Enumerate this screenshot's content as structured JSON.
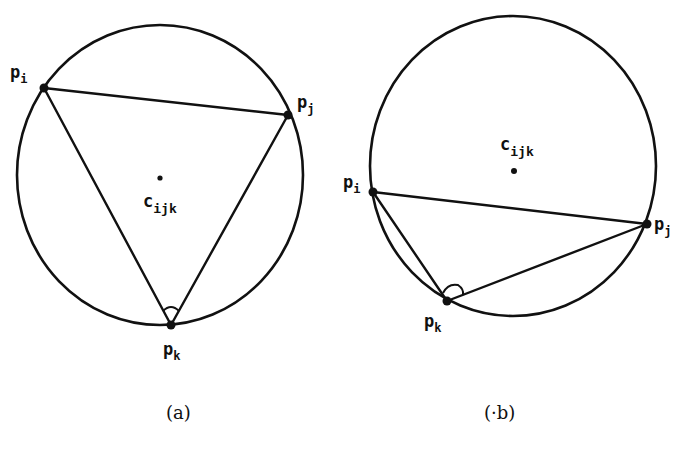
{
  "figure": {
    "panels": [
      {
        "id": "a",
        "caption": "(a)",
        "circle": {
          "cx": 160,
          "cy": 175,
          "rx": 143,
          "ry": 150
        },
        "center": {
          "x": 160,
          "y": 178,
          "label": "c",
          "sub": "ijk"
        },
        "points": {
          "pi": {
            "x": 44,
            "y": 88,
            "label": "p",
            "sub": "i"
          },
          "pj": {
            "x": 288,
            "y": 115,
            "label": "p",
            "sub": "j"
          },
          "pk": {
            "x": 171,
            "y": 325,
            "label": "p",
            "sub": "k"
          }
        },
        "angle_marker_at": "pk"
      },
      {
        "id": "b",
        "caption": "(·b)",
        "circle": {
          "cx": 513,
          "cy": 166,
          "rx": 143,
          "ry": 150
        },
        "center": {
          "x": 514,
          "y": 171,
          "label": "c",
          "sub": "ijk"
        },
        "points": {
          "pi": {
            "x": 373,
            "y": 192,
            "label": "p",
            "sub": "i"
          },
          "pj": {
            "x": 647,
            "y": 224,
            "label": "p",
            "sub": "j"
          },
          "pk": {
            "x": 447,
            "y": 301,
            "label": "p",
            "sub": "k"
          }
        },
        "angle_marker_at": "pk"
      }
    ],
    "stroke_color": "#111111",
    "background": "#ffffff"
  }
}
